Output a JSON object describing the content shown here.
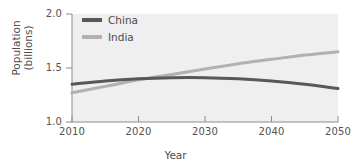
{
  "chart_data": {
    "type": "line",
    "title": "",
    "xlabel": "Year",
    "ylabel": "Population (billions)",
    "ylabel_lines": [
      "Population",
      "(billions)"
    ],
    "xlim": [
      2010,
      2050
    ],
    "ylim": [
      1.0,
      2.0
    ],
    "grid": false,
    "legend_position": "top-left",
    "xticks": [
      2010,
      2020,
      2030,
      2040,
      2050
    ],
    "xtick_labels": [
      "2010",
      "2020",
      "2030",
      "2040",
      "2050"
    ],
    "yticks": [
      1.0,
      1.5,
      2.0
    ],
    "ytick_labels": [
      "1.0",
      "1.5",
      "2.0"
    ],
    "x": [
      2010,
      2015,
      2020,
      2025,
      2030,
      2035,
      2040,
      2045,
      2050
    ],
    "series": [
      {
        "name": "China",
        "color": "#5b5658",
        "values": [
          1.35,
          1.38,
          1.4,
          1.41,
          1.41,
          1.4,
          1.38,
          1.35,
          1.31
        ]
      },
      {
        "name": "India",
        "color": "#b3b0b1",
        "values": [
          1.27,
          1.33,
          1.39,
          1.44,
          1.49,
          1.54,
          1.58,
          1.62,
          1.65
        ]
      }
    ]
  },
  "legend": {
    "items": [
      {
        "label": "China",
        "color": "#5b5658"
      },
      {
        "label": "India",
        "color": "#b3b0b1"
      }
    ]
  },
  "axes": {
    "x_title": "Year",
    "y_title_line1": "Population",
    "y_title_line2": "(billions)"
  }
}
